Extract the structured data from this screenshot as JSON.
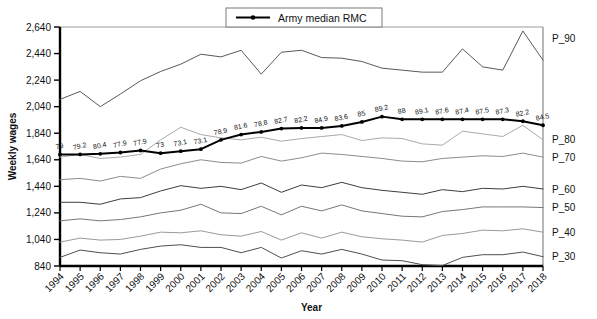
{
  "chart_data": {
    "type": "line",
    "title": "",
    "xlabel": "Year",
    "ylabel": "Weekly wages",
    "ylim": [
      840,
      2640
    ],
    "ytick_step": 200,
    "yticks": [
      "840",
      "1,040",
      "1,240",
      "1,440",
      "1,640",
      "1,840",
      "2,040",
      "2,240",
      "2,440",
      "2,640"
    ],
    "grid": false,
    "legend_position": "top-center",
    "legend": [
      {
        "name": "Army median RMC",
        "marker": "filled-circle",
        "color": "#000000"
      }
    ],
    "x": [
      1994,
      1995,
      1996,
      1997,
      1998,
      1999,
      2000,
      2001,
      2002,
      2003,
      2004,
      2005,
      2006,
      2007,
      2008,
      2009,
      2010,
      2011,
      2012,
      2013,
      2014,
      2015,
      2016,
      2017,
      2018
    ],
    "categories": [
      "1994",
      "1995",
      "1996",
      "1997",
      "1998",
      "1999",
      "2000",
      "2001",
      "2002",
      "2003",
      "2004",
      "2005",
      "2006",
      "2007",
      "2008",
      "2009",
      "2010",
      "2011",
      "2012",
      "2013",
      "2014",
      "2015",
      "2016",
      "2017",
      "2018"
    ],
    "series": [
      {
        "name": "P_90",
        "end_label": "P_90",
        "color": "#595959",
        "values": [
          2095,
          2155,
          2040,
          2135,
          2235,
          2305,
          2360,
          2435,
          2415,
          2465,
          2285,
          2450,
          2465,
          2410,
          2405,
          2380,
          2330,
          2315,
          2300,
          2300,
          2475,
          2340,
          2315,
          2610,
          2390
        ]
      },
      {
        "name": "P_80",
        "end_label": "P_80",
        "color": "#aaaaaa",
        "values": [
          1660,
          1680,
          1650,
          1660,
          1680,
          1790,
          1885,
          1830,
          1805,
          1790,
          1810,
          1780,
          1800,
          1815,
          1830,
          1785,
          1805,
          1800,
          1760,
          1750,
          1855,
          1835,
          1815,
          1900,
          1790
        ]
      },
      {
        "name": "P_70",
        "end_label": "P_70",
        "color": "#8c8c8c",
        "values": [
          1490,
          1500,
          1480,
          1515,
          1500,
          1570,
          1610,
          1640,
          1620,
          1615,
          1665,
          1630,
          1655,
          1690,
          1680,
          1665,
          1650,
          1630,
          1625,
          1650,
          1660,
          1670,
          1665,
          1690,
          1660
        ]
      },
      {
        "name": "P_60",
        "end_label": "P_60",
        "color": "#3d3d3d",
        "values": [
          1320,
          1320,
          1305,
          1345,
          1355,
          1405,
          1445,
          1425,
          1440,
          1415,
          1465,
          1395,
          1450,
          1430,
          1470,
          1430,
          1410,
          1395,
          1380,
          1415,
          1400,
          1425,
          1420,
          1440,
          1420
        ]
      },
      {
        "name": "P_50",
        "end_label": "P_50",
        "color": "#777777",
        "values": [
          1180,
          1195,
          1180,
          1190,
          1210,
          1240,
          1260,
          1305,
          1240,
          1235,
          1290,
          1225,
          1290,
          1255,
          1300,
          1255,
          1235,
          1215,
          1210,
          1250,
          1265,
          1285,
          1285,
          1285,
          1280
        ]
      },
      {
        "name": "P_40",
        "end_label": "P_40",
        "color": "#9a9a9a",
        "values": [
          1020,
          1050,
          1035,
          1040,
          1065,
          1095,
          1090,
          1105,
          1075,
          1065,
          1100,
          1035,
          1090,
          1050,
          1095,
          1060,
          1045,
          1035,
          1020,
          1070,
          1085,
          1110,
          1105,
          1120,
          1095
        ]
      },
      {
        "name": "P_30",
        "end_label": "P_30",
        "color": "#4f4f4f",
        "values": [
          905,
          960,
          940,
          930,
          965,
          990,
          1000,
          980,
          980,
          940,
          980,
          900,
          955,
          930,
          965,
          930,
          885,
          880,
          850,
          843,
          905,
          925,
          925,
          945,
          910
        ]
      },
      {
        "name": "Army median RMC",
        "end_label": "",
        "color": "#000000",
        "marker": true,
        "values": [
          1680,
          1680,
          1685,
          1695,
          1710,
          1690,
          1705,
          1720,
          1790,
          1830,
          1850,
          1875,
          1880,
          1880,
          1895,
          1925,
          1965,
          1945,
          1945,
          1945,
          1945,
          1945,
          1945,
          1930,
          1900
        ],
        "point_labels": [
          "79",
          "79.2",
          "80.4",
          "77.9",
          "77.9",
          "73",
          "73.1",
          "73.1",
          "78.9",
          "81.6",
          "78.8",
          "82.7",
          "82.2",
          "84.9",
          "83.6",
          "85",
          "89.2",
          "88",
          "89.1",
          "87.6",
          "87.4",
          "87.5",
          "87.3",
          "82.2",
          "84.5"
        ]
      }
    ]
  },
  "legend": {
    "entry_label": "Army median RMC"
  },
  "axes": {
    "y_title": "Weekly wages",
    "x_title": "Year"
  }
}
